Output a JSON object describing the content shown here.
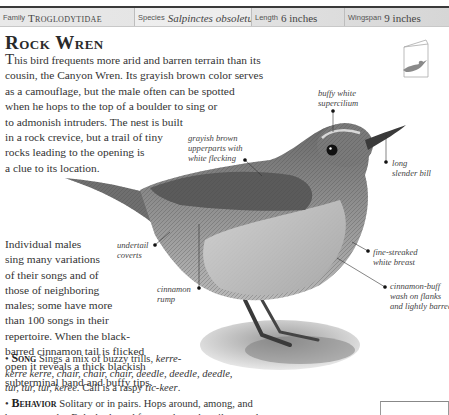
{
  "header": {
    "family_label": "Family",
    "family_value": "Troglodytidae",
    "species_label": "Species",
    "species_value": "Salpinctes obsoletus",
    "length_label": "Length",
    "length_value": "6 inches",
    "wingspan_label": "Wingspan",
    "wingspan_value": "9 inches"
  },
  "title": "Rock Wren",
  "intro": {
    "dropcap": "T",
    "lines": [
      "his bird frequents more arid and barren terrain than its",
      "cousin, the Canyon Wren. Its grayish brown color serves",
      "as a camouflage, but the male often can be spotted",
      "when he hops to the top of a boulder to sing or",
      "to admonish intruders. The nest is built",
      "in a rock crevice, but a trail of tiny",
      "rocks leading to the opening is",
      "a clue to its location."
    ]
  },
  "body2": {
    "lines": [
      "Individual males",
      "sing many variations",
      "of their songs and of",
      "those of neighboring",
      "males; some have more",
      "than 100 songs in their",
      "repertoire. When the black-",
      "barred cinnamon tail is flicked",
      "open it reveals a thick blackish",
      "subterminal band and buffy tips."
    ]
  },
  "song": {
    "bullet": "•",
    "heading": "Song",
    "line1_text": "Sings a mix of buzzy trills,",
    "line1_italic": "kerre-",
    "line2_italic": "kerre kerre, chair, chair, chair, deedle, deedle, deedle,",
    "line3_italic": "tur, tur, tur, keree.",
    "line3_text": "Call is a raspy",
    "line3_call": "tic-keer",
    "line3_end": "."
  },
  "behavior": {
    "bullet": "•",
    "heading": "Behavior",
    "line1_text": "Solitary or in pairs. Hops around, among, and",
    "line2_text": "between rocks. Bobs body and frequently cocks tail upward."
  },
  "labels": {
    "supercilium": [
      "buffy white",
      "supercilium"
    ],
    "upperparts": [
      "grayish brown",
      "upperparts with",
      "white flecking"
    ],
    "bill": [
      "long",
      "slender bill"
    ],
    "undertail": [
      "undertail",
      "coverts"
    ],
    "breast": [
      "fine-streaked",
      "white breast"
    ],
    "rump": [
      "cinnamon",
      "rump"
    ],
    "flanks": [
      "cinnamon-buff",
      "wash on flanks",
      "and lightly barred"
    ]
  },
  "icons": {
    "field_guide_book": "book-with-bird-icon",
    "bird_illustration": "rock-wren-illustration"
  },
  "colors": {
    "header_band": "#e4e4e4",
    "top_rule": "#3a3a3a",
    "text": "#333333",
    "bird_gray": "#8a8a8a"
  }
}
